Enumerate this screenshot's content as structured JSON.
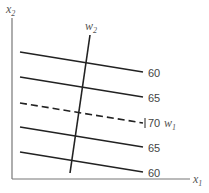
{
  "diagram": {
    "type": "indifference-curve-map",
    "axes": {
      "x_label": "x",
      "x_sub": "1",
      "y_label": "x",
      "y_sub": "2"
    },
    "rays": [
      {
        "name": "w",
        "sub": "2",
        "style": "solid"
      },
      {
        "name": "w",
        "sub": "1",
        "style": "dashed"
      }
    ],
    "lines": [
      {
        "label": "60",
        "style": "solid"
      },
      {
        "label": "65",
        "style": "solid"
      },
      {
        "label": "70",
        "style": "dashed"
      },
      {
        "label": "65",
        "style": "solid"
      },
      {
        "label": "60",
        "style": "solid"
      }
    ],
    "colors": {
      "line": "#222222",
      "axis": "#777777",
      "text": "#444444"
    }
  }
}
